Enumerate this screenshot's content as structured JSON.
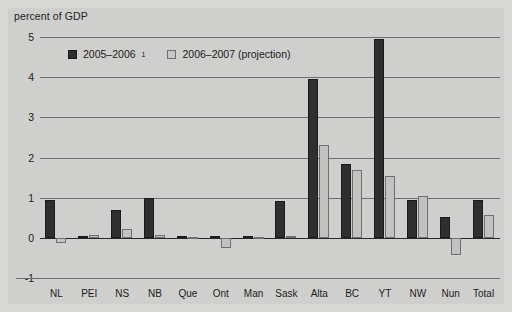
{
  "chart_data": {
    "type": "bar",
    "title": "",
    "ylabel": "percent of GDP",
    "xlabel": "",
    "ylim": [
      -1,
      5
    ],
    "yticks": [
      5,
      4,
      3,
      2,
      1,
      0,
      -1
    ],
    "ytick_labels": [
      "5",
      "4",
      "3",
      "2",
      "1",
      "0",
      "-1"
    ],
    "grid": true,
    "legend_position": "top-left-inside",
    "categories": [
      "NL",
      "PEI",
      "NS",
      "NB",
      "Que",
      "Ont",
      "Man",
      "Sask",
      "Alta",
      "BC",
      "YT",
      "NW",
      "Nun",
      "Total"
    ],
    "series": [
      {
        "name": "2005–2006",
        "footnote_marker": "1",
        "color": "#2f2f2f",
        "values": [
          0.93,
          0.05,
          0.7,
          0.98,
          0.04,
          0.05,
          0.04,
          0.92,
          3.95,
          1.85,
          4.95,
          0.93,
          0.52,
          0.95
        ]
      },
      {
        "name": "2006–2007 (projection)",
        "color": "#c2c2c0",
        "values": [
          -0.14,
          0.07,
          0.22,
          0.07,
          0.03,
          -0.25,
          0.03,
          0.04,
          2.3,
          1.68,
          1.55,
          1.04,
          -0.42,
          0.58
        ]
      }
    ]
  },
  "legend": {
    "items": [
      {
        "label": "2005–2006",
        "marker": "1",
        "swatch": "dark"
      },
      {
        "label": "2006–2007 (projection)",
        "marker": "",
        "swatch": "light"
      }
    ]
  },
  "colors": {
    "background": "#d9d9d7",
    "plot_background": "#cfcfcd",
    "series_1": "#2f2f2f",
    "series_2": "#c2c2c0",
    "gridline": "#6d6d6d",
    "zero_line": "#2a2a2a",
    "text": "#1c1c1c"
  }
}
